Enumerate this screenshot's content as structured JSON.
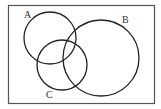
{
  "diagram": {
    "type": "venn",
    "frame": {
      "x": 8,
      "y": 5,
      "width": 146,
      "height": 98,
      "stroke": "#555555"
    },
    "stroke_color": "#222222",
    "sets": [
      {
        "id": "A",
        "label": "A",
        "cx": 50,
        "cy": 38,
        "r": 26,
        "label_x": 24,
        "label_y": 18
      },
      {
        "id": "B",
        "label": "B",
        "cx": 101,
        "cy": 58,
        "r": 38,
        "label_x": 122,
        "label_y": 23
      },
      {
        "id": "C",
        "label": "C",
        "cx": 62,
        "cy": 65,
        "r": 25,
        "label_x": 46,
        "label_y": 98
      }
    ]
  }
}
